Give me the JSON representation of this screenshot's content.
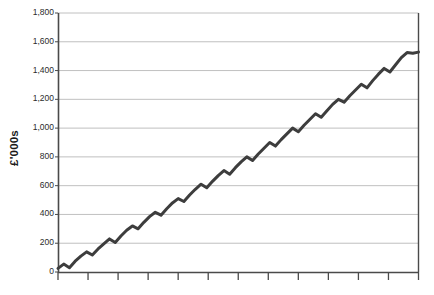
{
  "chart_data": {
    "type": "line",
    "title": "",
    "subtitle": "",
    "xlabel": "",
    "ylabel": "£'000s",
    "ylim": [
      0,
      1800
    ],
    "ytick_values": [
      0,
      200,
      400,
      600,
      800,
      1000,
      1200,
      1400,
      1600,
      1800
    ],
    "ytick_labels": [
      "0",
      "200",
      "400",
      "600",
      "800",
      "1,000",
      "1,200",
      "1,400",
      "1,600",
      "1,800"
    ],
    "xtick_labels": [],
    "xtick_count": 13,
    "grid": true,
    "grid_axis": "y",
    "legend": false,
    "legend_position": "none",
    "annotations": [],
    "series": [
      {
        "name": "Cumulative value",
        "color": "#3d3d3d",
        "line_width": 3,
        "values": [
          25,
          55,
          30,
          75,
          110,
          140,
          118,
          160,
          195,
          230,
          205,
          250,
          290,
          320,
          300,
          345,
          385,
          415,
          395,
          440,
          480,
          510,
          490,
          535,
          575,
          610,
          585,
          630,
          670,
          705,
          680,
          725,
          765,
          800,
          775,
          820,
          860,
          900,
          875,
          920,
          960,
          1000,
          975,
          1020,
          1060,
          1100,
          1075,
          1120,
          1165,
          1200,
          1180,
          1225,
          1265,
          1305,
          1280,
          1330,
          1375,
          1415,
          1390,
          1440,
          1490,
          1525,
          1520,
          1528
        ],
        "x": [
          0,
          1,
          2,
          3,
          4,
          5,
          6,
          7,
          8,
          9,
          10,
          11,
          12,
          13,
          14,
          15,
          16,
          17,
          18,
          19,
          20,
          21,
          22,
          23,
          24,
          25,
          26,
          27,
          28,
          29,
          30,
          31,
          32,
          33,
          34,
          35,
          36,
          37,
          38,
          39,
          40,
          41,
          42,
          43,
          44,
          45,
          46,
          47,
          48,
          49,
          50,
          51,
          52,
          53,
          54,
          55,
          56,
          57,
          58,
          59,
          60,
          61,
          62,
          63
        ]
      }
    ],
    "colors": {
      "line": "#3d3d3d",
      "grid": "#b9b9b9",
      "axis": "#4a4a4a",
      "text": "#2b2b2b",
      "background": "#ffffff"
    }
  }
}
